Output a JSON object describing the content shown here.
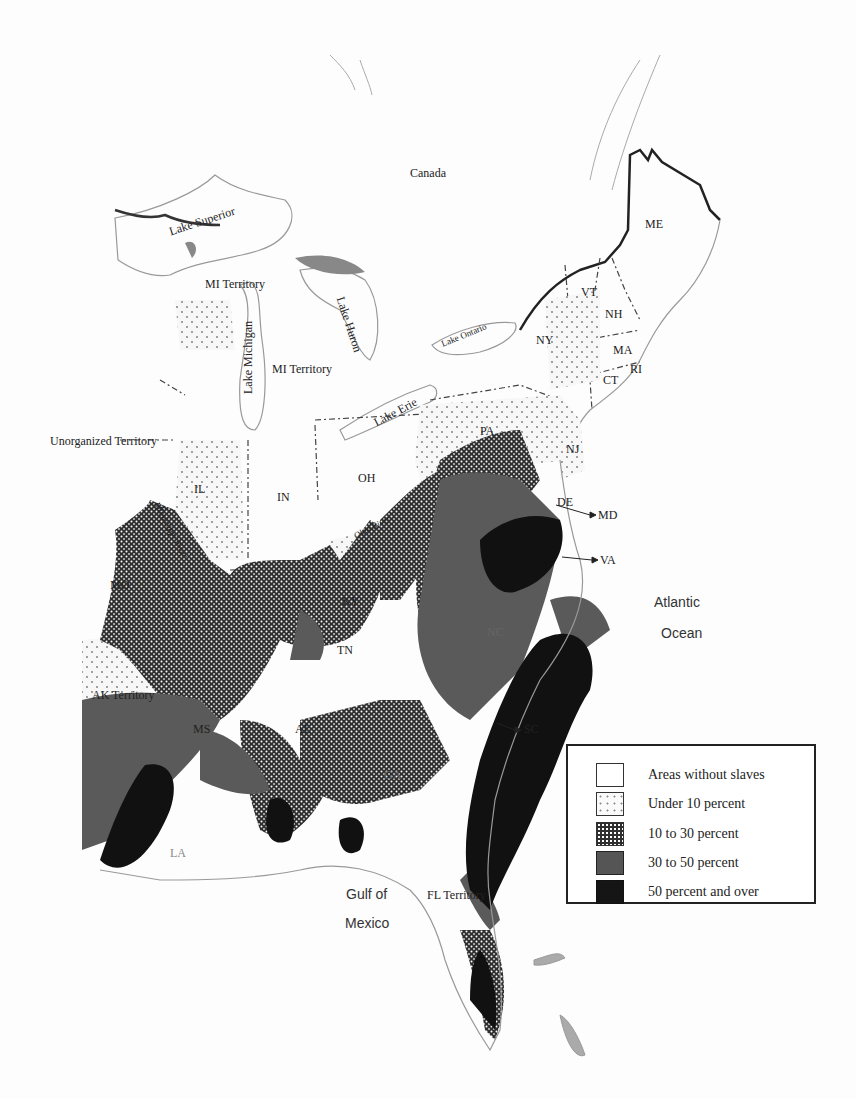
{
  "map": {
    "regions": {
      "canada": "Canada",
      "lake_superior": "Lake Superior",
      "mi_territory_north": "MI Territory",
      "mi_territory_south": "MI Territory",
      "lake_michigan": "Lake Michigan",
      "lake_huron": "Lake Huron",
      "lake_erie": "Lake Erie",
      "lake_ontario": "Lake Ontario",
      "unorganized_territory": "Unorganized Territory",
      "me": "ME",
      "vt": "VT",
      "nh": "NH",
      "ma": "MA",
      "ri": "RI",
      "ct": "CT",
      "ny": "NY",
      "pa": "PA",
      "nj": "NJ",
      "de": "DE",
      "md": "MD",
      "va": "VA",
      "nc": "NC",
      "sc": "SC",
      "ga": "GA",
      "al": "AL",
      "ms": "MS",
      "la": "LA",
      "tn": "TN",
      "ky": "KY",
      "oh": "OH",
      "in": "IN",
      "il": "IL",
      "mo": "MO",
      "ak_territory": "AK Territory",
      "fl_territory": "FL Territory",
      "mississippi_river": "Mississippi River",
      "ohio_river": "Ohio River",
      "atlantic_1": "Atlantic",
      "atlantic_2": "Ocean",
      "gulf_1": "Gulf of",
      "gulf_2": "Mexico"
    },
    "legend": [
      {
        "label": "Areas without slaves",
        "fill": "#ffffff",
        "pattern": "none"
      },
      {
        "label": "Under 10 percent",
        "fill": "#f4f4f4",
        "pattern": "sparse-dots"
      },
      {
        "label": "10 to 30 percent",
        "fill": "#3a3a3a",
        "pattern": "dense-white-dots"
      },
      {
        "label": "30 to 50 percent",
        "fill": "#5a5a5a",
        "pattern": "solid"
      },
      {
        "label": "50 percent and over",
        "fill": "#111111",
        "pattern": "solid"
      }
    ]
  }
}
